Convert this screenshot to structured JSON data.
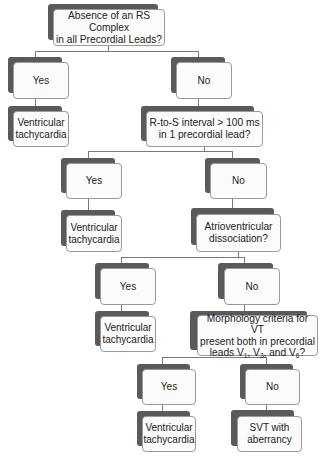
{
  "diagram": {
    "type": "decision-tree",
    "colors": {
      "shadow": "#5a5a5a",
      "box_fill": "#fbfbfb",
      "box_border": "#9a9a9a",
      "connector": "#7a7a7a"
    },
    "q1": {
      "text_line1": "Absence of an RS Complex",
      "text_line2": "in all Precordial Leads?"
    },
    "q1_yes": {
      "label": "Yes"
    },
    "q1_yes_result": {
      "line1": "Ventricular",
      "line2": "tachycardia"
    },
    "q1_no": {
      "label": "No"
    },
    "q2": {
      "text_line1": "R-to-S interval > 100 ms",
      "text_line2": "in 1 precordial lead?"
    },
    "q2_yes": {
      "label": "Yes"
    },
    "q2_yes_result": {
      "line1": "Ventricular",
      "line2": "tachycardia"
    },
    "q2_no": {
      "label": "No"
    },
    "q3": {
      "text_line1": "Atrioventricular",
      "text_line2": "dissociation?"
    },
    "q3_yes": {
      "label": "Yes"
    },
    "q3_yes_result": {
      "line1": "Ventricular",
      "line2": "tachycardia"
    },
    "q3_no": {
      "label": "No"
    },
    "q4": {
      "text_line1": "Morphology criteria for VT",
      "text_line2": "present both in precordial",
      "text_line3_prefix": "leads V",
      "sub1": "1",
      "sep1": ", V",
      "sub2": "2",
      "sep2": ", and V",
      "sub3": "6",
      "suffix": "?"
    },
    "q4_yes": {
      "label": "Yes"
    },
    "q4_yes_result": {
      "line1": "Ventricular",
      "line2": "tachycardia"
    },
    "q4_no": {
      "label": "No"
    },
    "q4_no_result": {
      "line1": "SVT with",
      "line2": "aberrancy"
    }
  }
}
